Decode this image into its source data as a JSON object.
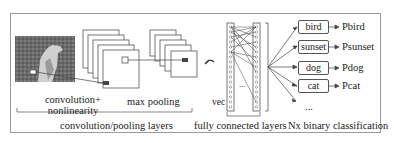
{
  "diagram": {
    "stages": {
      "conv_label_line1": "convolution+",
      "conv_label_line2": "nonlinearity",
      "pool_label": "max pooling",
      "vec_label": "vec",
      "ellipsis_fc": "...",
      "ellipsis_out": "..."
    },
    "groups": {
      "conv_pool": "convolution/pooling layers",
      "fc": "fully connected layers",
      "classification": "Nx binary classification"
    },
    "classes": [
      {
        "label": "bird",
        "prob": "Pbird"
      },
      {
        "label": "sunset",
        "prob": "Psunset"
      },
      {
        "label": "dog",
        "prob": "Pdog"
      },
      {
        "label": "cat",
        "prob": "Pcat"
      }
    ],
    "colors": {
      "frame": "#9a9a9a",
      "stroke": "#555555",
      "text": "#222222"
    }
  }
}
